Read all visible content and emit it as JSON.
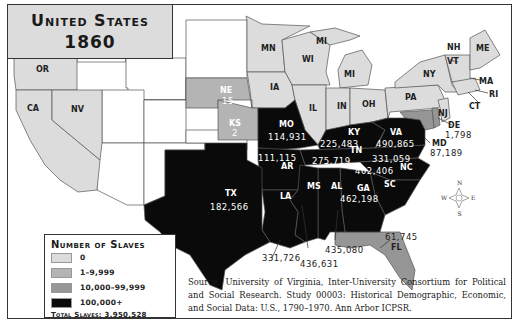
{
  "title": {
    "line1": "United States",
    "line2": "1860"
  },
  "colors": {
    "zero": "#dcdcdc",
    "low": "#b4b4b4",
    "mid": "#969696",
    "high": "#0a0a0a",
    "territory": "#ffffff",
    "border": "#555555"
  },
  "legend": {
    "title": "Number of Slaves",
    "items": [
      {
        "label": "0",
        "color": "#dcdcdc"
      },
      {
        "label": "1–9,999",
        "color": "#b4b4b4"
      },
      {
        "label": "10,000–99,999",
        "color": "#969696"
      },
      {
        "label": "100,000+",
        "color": "#0a0a0a"
      }
    ],
    "total": "Total Slaves: 3,950,528"
  },
  "states": {
    "OR": {
      "label": "OR",
      "value": null
    },
    "CA": {
      "label": "CA",
      "value": null
    },
    "NV": {
      "label": "NV",
      "value": null
    },
    "MN": {
      "label": "MN",
      "value": null
    },
    "WI": {
      "label": "WI",
      "value": null
    },
    "MI_upper": {
      "label": "MI",
      "value": null
    },
    "MI": {
      "label": "MI",
      "value": null
    },
    "IA": {
      "label": "IA",
      "value": null
    },
    "IL": {
      "label": "IL",
      "value": null
    },
    "IN": {
      "label": "IN",
      "value": null
    },
    "OH": {
      "label": "OH",
      "value": null
    },
    "PA": {
      "label": "PA",
      "value": null
    },
    "NY": {
      "label": "NY",
      "value": null
    },
    "NH": {
      "label": "NH",
      "value": null
    },
    "VT": {
      "label": "VT",
      "value": null
    },
    "ME": {
      "label": "ME",
      "value": null
    },
    "MA": {
      "label": "MA",
      "value": null
    },
    "RI": {
      "label": "RI",
      "value": null
    },
    "CT": {
      "label": "CT",
      "value": null
    },
    "NJ": {
      "label": "NJ",
      "value": null
    },
    "NE": {
      "label": "NE",
      "value": "15"
    },
    "KS": {
      "label": "KS",
      "value": "2"
    },
    "DE": {
      "label": "DE",
      "value": "1,798"
    },
    "MD": {
      "label": "MD",
      "value": "87,189"
    },
    "FL": {
      "label": "FL",
      "value": "61,745"
    },
    "MO": {
      "label": "MO",
      "value": "114,931"
    },
    "KY": {
      "label": "KY",
      "value": "225,483"
    },
    "VA": {
      "label": "VA",
      "value": "490,865"
    },
    "AR": {
      "label": "AR",
      "value": "111,115"
    },
    "TN": {
      "label": "TN",
      "value": "275,719"
    },
    "NC": {
      "label": "NC",
      "value": "331,059"
    },
    "SC": {
      "label": "SC",
      "value": "402,406"
    },
    "GA": {
      "label": "GA",
      "value": "462,198"
    },
    "AL": {
      "label": "AL",
      "value": "435,080"
    },
    "MS": {
      "label": "MS",
      "value": "436,631"
    },
    "LA": {
      "label": "LA",
      "value": "331,726"
    },
    "TX": {
      "label": "TX",
      "value": "182,566"
    }
  },
  "compass": {
    "n": "N",
    "s": "S",
    "e": "E",
    "w": "W"
  },
  "source": "Source: University of Virginia, Inter-University Consortium for Political and Social Research. Study 00003: Historical Demographic, Economic, and Social Data: U.S., 1790–1970. Ann Arbor ICPSR."
}
